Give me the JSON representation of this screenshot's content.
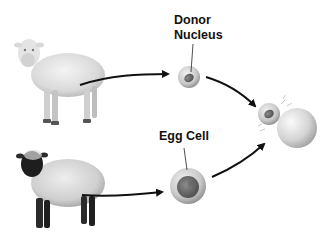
{
  "diagram": {
    "type": "process",
    "topic": "cloning by nuclear transfer",
    "nodes": [
      {
        "id": "white-sheep",
        "kind": "illustration",
        "description": "white-faced sheep (nucleus donor)"
      },
      {
        "id": "black-sheep",
        "kind": "illustration",
        "description": "black-faced sheep (egg donor)"
      },
      {
        "id": "donor-nucleus",
        "kind": "cell",
        "label_lines": [
          "Donor",
          "Nucleus"
        ]
      },
      {
        "id": "egg-cell",
        "kind": "cell",
        "label": "Egg Cell"
      },
      {
        "id": "fused-cell",
        "kind": "cell",
        "description": "small cell fusing with larger cell"
      }
    ],
    "edges": [
      {
        "from": "white-sheep",
        "to": "donor-nucleus"
      },
      {
        "from": "black-sheep",
        "to": "egg-cell"
      },
      {
        "from": "donor-nucleus",
        "to": "fused-cell"
      },
      {
        "from": "egg-cell",
        "to": "fused-cell"
      }
    ]
  },
  "labels": {
    "donor_line1": "Donor",
    "donor_line2": "Nucleus",
    "egg": "Egg Cell"
  },
  "colors": {
    "background": "#ffffff",
    "arrow": "#111111",
    "text": "#111111"
  }
}
